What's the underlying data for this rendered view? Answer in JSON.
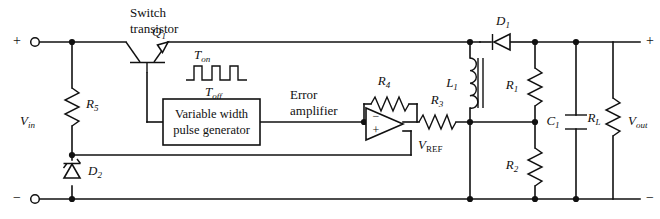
{
  "figure": {
    "type": "schematic",
    "background_color": "#ffffff",
    "line_color": "#111111"
  },
  "terminals": {
    "input_plus": "+",
    "input_minus": "−",
    "output_plus": "+",
    "output_minus": "−"
  },
  "labels": {
    "vin": "V",
    "vin_sub": "in",
    "vout": "V",
    "vout_sub": "out",
    "vref": "V",
    "vref_sub": "REF",
    "switch_transistor_line1": "Switch",
    "switch_transistor_line2": "transistor",
    "error_amp_line1": "Error",
    "error_amp_line2": "amplifier",
    "ton": "T",
    "ton_sub": "on",
    "toff": "T",
    "toff_sub": "off",
    "pulse_gen_line1": "Variable width",
    "pulse_gen_line2": "pulse generator"
  },
  "components": [
    {
      "id": "Q1",
      "base": "Q",
      "sub": "1",
      "kind": "npn-transistor",
      "name": "switch transistor"
    },
    {
      "id": "R5",
      "base": "R",
      "sub": "5",
      "kind": "resistor",
      "name": "bias resistor"
    },
    {
      "id": "D2",
      "base": "D",
      "sub": "2",
      "kind": "zener-diode",
      "name": "reference zener diode"
    },
    {
      "id": "R4",
      "base": "R",
      "sub": "4",
      "kind": "resistor",
      "name": "feedback resistor"
    },
    {
      "id": "R3",
      "base": "R",
      "sub": "3",
      "kind": "resistor",
      "name": "series resistor"
    },
    {
      "id": "D1",
      "base": "D",
      "sub": "1",
      "kind": "diode",
      "name": "flyback diode"
    },
    {
      "id": "L1",
      "base": "L",
      "sub": "1",
      "kind": "inductor",
      "name": "filter inductor"
    },
    {
      "id": "R1",
      "base": "R",
      "sub": "1",
      "kind": "resistor",
      "name": "upper divider resistor"
    },
    {
      "id": "R2",
      "base": "R",
      "sub": "2",
      "kind": "resistor",
      "name": "lower divider resistor"
    },
    {
      "id": "C1",
      "base": "C",
      "sub": "1",
      "kind": "capacitor",
      "name": "output filter capacitor"
    },
    {
      "id": "RL",
      "base": "R",
      "sub": "L",
      "kind": "resistor",
      "name": "load resistor"
    }
  ],
  "opamp": {
    "inverting_label": "−",
    "noninverting_label": "+"
  },
  "waveform": {
    "pulse_count": 3,
    "description": "rectangular pulse train"
  }
}
